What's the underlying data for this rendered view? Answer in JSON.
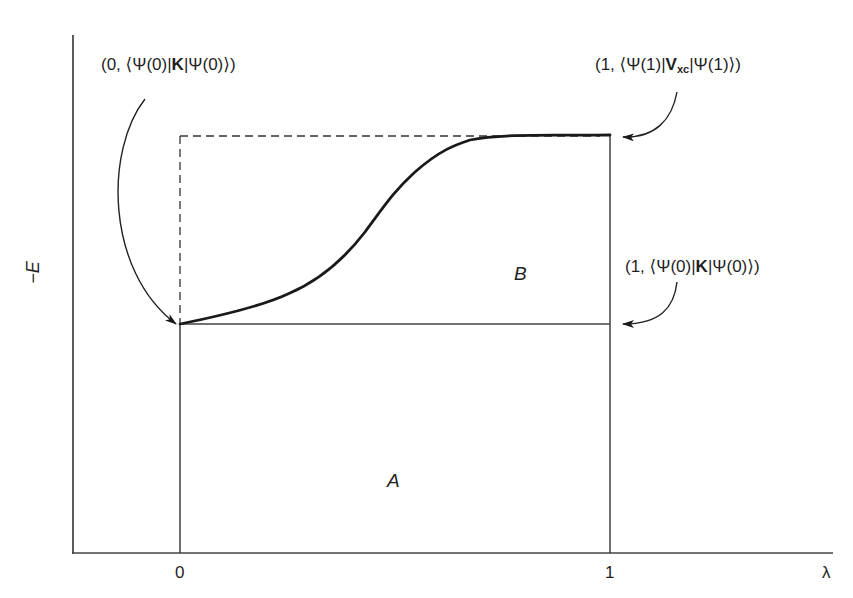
{
  "diagram": {
    "axes": {
      "y_label": "−E",
      "x_label": "λ",
      "x_ticks": [
        "0",
        "1"
      ]
    },
    "regions": {
      "A": "A",
      "B": "B"
    },
    "annotations": {
      "start_point": {
        "prefix": "(0, ⟨Ψ(0)|",
        "operator": "K",
        "suffix": "|Ψ(0)⟩)"
      },
      "end_point": {
        "prefix": "(1, ⟨Ψ(1)|",
        "operator": "V",
        "operator_sub": "xc",
        "suffix": "|Ψ(1)⟩)"
      },
      "lower_right_point": {
        "prefix": "(1, ⟨Ψ(0)|",
        "operator": "K",
        "suffix": "|Ψ(0)⟩)"
      }
    },
    "curve": {
      "description": "sigmoidal rise of -E from lambda=0 to lambda=1",
      "color": "#1a1a1a"
    }
  }
}
